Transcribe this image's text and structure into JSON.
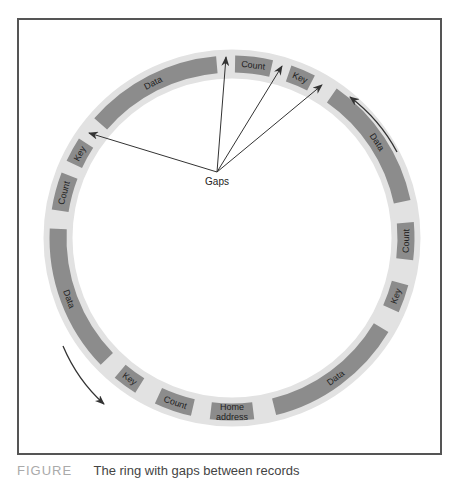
{
  "figure": {
    "center": [
      232,
      238
    ],
    "ring_radius": 174,
    "ring_width": 29,
    "colors": {
      "ring": "#e2e2e2",
      "segment": "#8c8c8c",
      "text": "#222222",
      "arrow": "#333333",
      "frame": "#555555"
    },
    "segments": [
      {
        "label": "Count",
        "start": 1,
        "end": 13
      },
      {
        "label": "Key",
        "start": 19,
        "end": 27
      },
      {
        "label": "Data",
        "start": 35,
        "end": 78
      },
      {
        "label": "Count",
        "start": 85,
        "end": 97
      },
      {
        "label": "Key",
        "start": 105,
        "end": 114
      },
      {
        "label": "Data",
        "start": 121,
        "end": 166
      },
      {
        "label": "Home address",
        "start": 173,
        "end": 187,
        "lines": [
          "Home",
          "address"
        ]
      },
      {
        "label": "Count",
        "start": 193,
        "end": 205
      },
      {
        "label": "Key",
        "start": 212,
        "end": 220
      },
      {
        "label": "Data",
        "start": 226,
        "end": 273
      },
      {
        "label": "Count",
        "start": 279,
        "end": 291
      },
      {
        "label": "Key",
        "start": 295,
        "end": 303
      },
      {
        "label": "Data",
        "start": 311,
        "end": 355
      }
    ],
    "gaps_label": {
      "text": "Gaps",
      "x": 217,
      "y": 185
    },
    "gaps_origin": [
      217,
      172
    ],
    "gap_arrow_targets": [
      [
        226,
        57
      ],
      [
        282,
        66
      ],
      [
        322,
        85
      ],
      [
        89,
        133
      ]
    ],
    "direction_arrows": [
      {
        "from": [
          397,
          152
        ],
        "to": [
          350,
          97
        ]
      },
      {
        "from": [
          63,
          346
        ],
        "to": [
          104,
          404
        ]
      }
    ]
  },
  "caption": {
    "figure_number": "FIGURE",
    "text": "The ring with gaps between records"
  }
}
